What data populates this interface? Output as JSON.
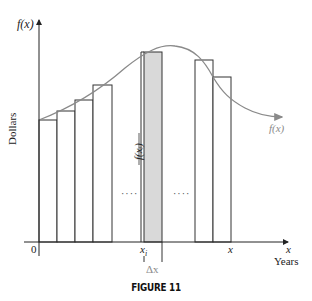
{
  "figure": {
    "caption": "FIGURE 11",
    "y_axis_label": "f(x)",
    "y_axis_title": "Dollars",
    "x_axis_label": "x",
    "x_axis_title": "Years",
    "origin_label": "0",
    "xi_label": "x",
    "xi_subscript": "i",
    "x_tick_label": "x",
    "delta_label": "Δx",
    "curve_label": "f(x)",
    "bar_height_label": "f(xᵢ)",
    "ellipsis_left": "····",
    "ellipsis_right": "····",
    "colors": {
      "axis": "#222222",
      "curve": "#8a8a8a",
      "bar_outline": "#333333",
      "shaded_bar": "#d9d9d9",
      "delta_label": "#8a8a8a"
    }
  }
}
